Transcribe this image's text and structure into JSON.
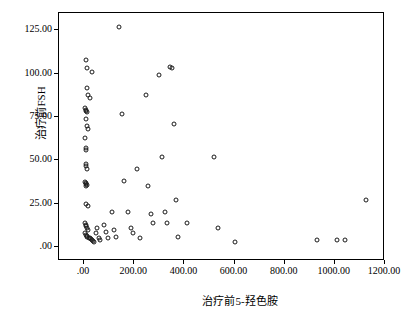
{
  "chart_data": {
    "type": "scatter",
    "title": "",
    "xlabel": "治疗前5-羟色胺",
    "ylabel": "治疗前FSH",
    "xlim": [
      -100,
      1200
    ],
    "ylim": [
      -8,
      135
    ],
    "xticks": [
      ".00",
      "200.00",
      "400.00",
      "600.00",
      "800.00",
      "1000.00",
      "1200.00"
    ],
    "xtick_values": [
      0,
      200,
      400,
      600,
      800,
      1000,
      1200
    ],
    "yticks": [
      ".00",
      "25.00",
      "50.00",
      "75.00",
      "100.00",
      "125.00"
    ],
    "ytick_values": [
      0,
      25,
      50,
      75,
      100,
      125
    ],
    "grid": false,
    "legend": null,
    "marker": "open-circle",
    "points": [
      [
        8,
        108.0
      ],
      [
        12,
        103.0
      ],
      [
        30,
        101.0
      ],
      [
        10,
        92.0
      ],
      [
        14,
        88.0
      ],
      [
        22,
        86.0
      ],
      [
        5,
        80.5
      ],
      [
        6,
        78.5
      ],
      [
        9,
        79.0
      ],
      [
        13,
        78.0
      ],
      [
        7,
        74.0
      ],
      [
        11,
        70.0
      ],
      [
        16,
        68.0
      ],
      [
        5,
        63.0
      ],
      [
        8,
        57.0
      ],
      [
        9,
        56.0
      ],
      [
        6,
        48.0
      ],
      [
        7,
        47.0
      ],
      [
        10,
        45.0
      ],
      [
        5,
        37.5
      ],
      [
        7,
        37.0
      ],
      [
        9,
        36.5
      ],
      [
        11,
        36.0
      ],
      [
        6,
        35.5
      ],
      [
        8,
        25.0
      ],
      [
        14,
        24.0
      ],
      [
        4,
        14.0
      ],
      [
        6,
        13.0
      ],
      [
        9,
        12.0
      ],
      [
        12,
        11.0
      ],
      [
        16,
        10.0
      ],
      [
        5,
        8.0
      ],
      [
        7,
        7.0
      ],
      [
        10,
        6.5
      ],
      [
        13,
        6.0
      ],
      [
        18,
        5.5
      ],
      [
        22,
        5.0
      ],
      [
        26,
        4.5
      ],
      [
        30,
        4.0
      ],
      [
        35,
        3.5
      ],
      [
        40,
        3.0
      ],
      [
        46,
        8.0
      ],
      [
        52,
        11.0
      ],
      [
        58,
        5.0
      ],
      [
        64,
        4.0
      ],
      [
        78,
        12.5
      ],
      [
        88,
        9.0
      ],
      [
        96,
        5.0
      ],
      [
        110,
        20.0
      ],
      [
        118,
        10.0
      ],
      [
        126,
        6.0
      ],
      [
        140,
        127.0
      ],
      [
        150,
        77.0
      ],
      [
        158,
        38.0
      ],
      [
        176,
        20.0
      ],
      [
        186,
        11.0
      ],
      [
        196,
        8.0
      ],
      [
        212,
        45.0
      ],
      [
        222,
        5.0
      ],
      [
        246,
        88.0
      ],
      [
        256,
        35.0
      ],
      [
        266,
        19.0
      ],
      [
        276,
        14.0
      ],
      [
        300,
        99.0
      ],
      [
        312,
        52.0
      ],
      [
        322,
        20.0
      ],
      [
        330,
        14.0
      ],
      [
        342,
        104.0
      ],
      [
        352,
        103.0
      ],
      [
        360,
        71.0
      ],
      [
        368,
        27.0
      ],
      [
        376,
        6.0
      ],
      [
        412,
        14.0
      ],
      [
        520,
        52.0
      ],
      [
        536,
        11.0
      ],
      [
        600,
        3.0
      ],
      [
        930,
        4.0
      ],
      [
        1010,
        4.0
      ],
      [
        1040,
        4.0
      ],
      [
        1125,
        27.0
      ]
    ]
  }
}
